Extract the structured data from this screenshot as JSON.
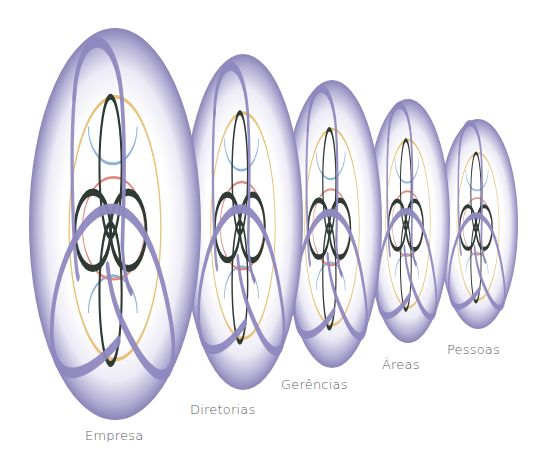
{
  "diagram": {
    "levels": [
      {
        "id": "empresa",
        "label": "Empresa",
        "cx": 115,
        "cy": 224,
        "rx": 86,
        "ry": 196,
        "label_x": 85,
        "label_y": 428
      },
      {
        "id": "diretorias",
        "label": "Diretorias",
        "cx": 243,
        "cy": 222,
        "rx": 60,
        "ry": 168,
        "label_x": 190,
        "label_y": 402
      },
      {
        "id": "gerencias",
        "label": "Gerências",
        "cx": 332,
        "cy": 224,
        "rx": 50,
        "ry": 144,
        "label_x": 281,
        "label_y": 377
      },
      {
        "id": "areas",
        "label": "Áreas",
        "cx": 408,
        "cy": 221,
        "rx": 42,
        "ry": 122,
        "label_x": 382,
        "label_y": 357
      },
      {
        "id": "pessoas",
        "label": "Pessoas",
        "cx": 478,
        "cy": 224,
        "rx": 40,
        "ry": 105,
        "label_x": 447,
        "label_y": 342
      }
    ],
    "colors": {
      "ring": "#8a84b8",
      "ring_light": "#f2f1f8",
      "ribbon": "#8e88bf",
      "knot": "#2f3a34",
      "gold": "#e9c27a",
      "blue": "#8fb4d8",
      "red": "#e08a86"
    }
  }
}
